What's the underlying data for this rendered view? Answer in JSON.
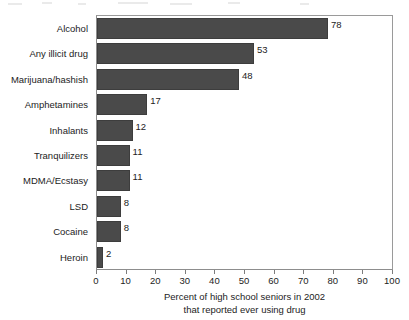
{
  "chart_data": {
    "type": "bar",
    "orientation": "horizontal",
    "title": "",
    "xlabel_line1": "Percent of high school seniors in 2002",
    "xlabel_line2": "that reported ever using drug",
    "ylabel": "",
    "xlim": [
      0,
      100
    ],
    "xticks": [
      "0",
      "10",
      "20",
      "30",
      "40",
      "50",
      "60",
      "70",
      "80",
      "90",
      "100"
    ],
    "grid": false,
    "legend": null,
    "categories": [
      "Alcohol",
      "Any illicit drug",
      "Marijuana/hashish",
      "Amphetamines",
      "Inhalants",
      "Tranquilizers",
      "MDMA/Ecstasy",
      "LSD",
      "Cocaine",
      "Heroin"
    ],
    "values": [
      78,
      53,
      48,
      17,
      12,
      11,
      11,
      8,
      8,
      2
    ],
    "value_labels": [
      "78",
      "53",
      "48",
      "17",
      "12",
      "11",
      "11",
      "8",
      "8",
      "2"
    ],
    "bar_color": "#4a4a4a",
    "frame_color": "#8d8d8d",
    "background_color": "#ffffff",
    "text_color": "#1c1c1c"
  }
}
